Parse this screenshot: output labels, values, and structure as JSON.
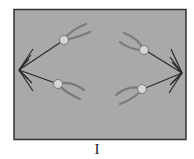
{
  "diagram": {
    "label": "I",
    "colors": {
      "background": "#a9a9a9",
      "border": "#333333",
      "spindle": "#2a2a2a",
      "chromosome": "#7a7a7a",
      "centromere_fill": "#d6d6d6",
      "centromere_stroke": "#777777"
    }
  }
}
